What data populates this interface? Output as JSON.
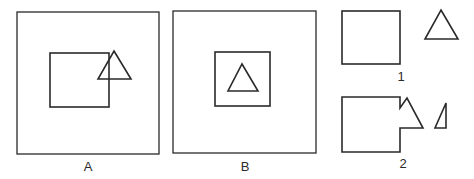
{
  "figure": {
    "panels": [
      {
        "id": "A",
        "label": "A",
        "description": "Large square containing a rectangle overlapped by a triangle at its upper-right corner"
      },
      {
        "id": "B",
        "label": "B",
        "description": "Large square containing a smaller square with a triangle inside"
      },
      {
        "id": "1",
        "label": "1",
        "description": "Separated rectangle and triangle"
      },
      {
        "id": "2",
        "label": "2",
        "description": "Rectangle merged with partial triangle forming notched shape, plus small right triangle fragment"
      }
    ],
    "colors": {
      "stroke": "#2a2a2a",
      "background": "#ffffff"
    }
  }
}
